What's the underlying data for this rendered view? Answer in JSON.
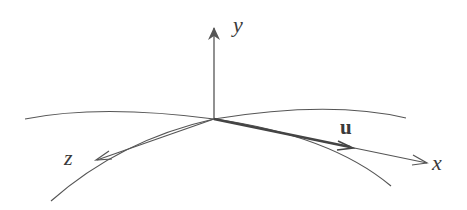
{
  "diagram": {
    "type": "coordinate-frame-on-surface",
    "colors": {
      "stroke": "#555555",
      "text": "#3a3a3a",
      "background": "#ffffff"
    },
    "origin": [
      214,
      119
    ],
    "axes": [
      {
        "name": "y",
        "label": "y",
        "from": [
          214,
          119
        ],
        "to": [
          214,
          27
        ]
      },
      {
        "name": "x",
        "label": "x",
        "from": [
          214,
          119
        ],
        "to": [
          427,
          163
        ]
      },
      {
        "name": "z",
        "label": "z",
        "from": [
          214,
          119
        ],
        "to": [
          96,
          160
        ]
      }
    ],
    "vector": {
      "name": "u",
      "label": "u",
      "from": [
        214,
        119
      ],
      "to": [
        352,
        148
      ]
    },
    "curves": [
      {
        "name": "upper-left-arc",
        "points": [
          [
            25,
            119
          ],
          [
            100,
            111
          ],
          [
            214,
            119
          ]
        ]
      },
      {
        "name": "upper-right-arc",
        "points": [
          [
            214,
            119
          ],
          [
            330,
            109
          ],
          [
            406,
            118
          ]
        ]
      },
      {
        "name": "lower-left-arc",
        "points": [
          [
            214,
            119
          ],
          [
            130,
            145
          ],
          [
            51,
            201
          ]
        ]
      },
      {
        "name": "lower-right-arc",
        "points": [
          [
            214,
            119
          ],
          [
            320,
            140
          ],
          [
            391,
            186
          ]
        ]
      }
    ]
  },
  "labels": {
    "y": "y",
    "x": "x",
    "z": "z",
    "u": "u"
  }
}
